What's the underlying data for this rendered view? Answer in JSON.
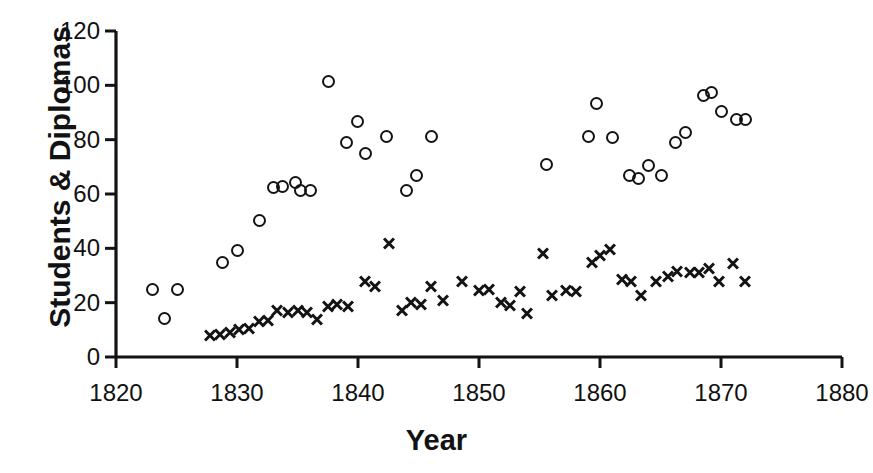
{
  "chart_data": {
    "type": "scatter",
    "title": "",
    "xlabel": "Year",
    "ylabel": "Students & Diplomas",
    "xlim": [
      1820,
      1880
    ],
    "ylim": [
      0,
      120
    ],
    "xticks": [
      1820,
      1830,
      1840,
      1850,
      1860,
      1870,
      1880
    ],
    "xtick_labels": [
      "1820",
      "1830",
      "1840",
      "1850",
      "1860",
      "1870",
      "1880"
    ],
    "yticks": [
      0,
      20,
      40,
      60,
      80,
      100,
      120
    ],
    "ytick_labels": [
      "0",
      "20",
      "40",
      "60",
      "80",
      "100",
      "120"
    ],
    "grid": false,
    "legend": null,
    "marker_color": "#131313",
    "axis_color": "#131313",
    "series": [
      {
        "name": "Students",
        "marker": "circle",
        "points": [
          [
            1823.0,
            25.0
          ],
          [
            1824.0,
            14.5
          ],
          [
            1825.0,
            25.0
          ],
          [
            1828.8,
            35.0
          ],
          [
            1830.0,
            39.5
          ],
          [
            1831.8,
            50.5
          ],
          [
            1833.0,
            62.5
          ],
          [
            1833.7,
            63.0
          ],
          [
            1834.8,
            64.5
          ],
          [
            1835.2,
            61.5
          ],
          [
            1836.0,
            61.5
          ],
          [
            1837.5,
            101.5
          ],
          [
            1839.0,
            79.0
          ],
          [
            1839.9,
            87.0
          ],
          [
            1840.6,
            75.0
          ],
          [
            1842.3,
            81.5
          ],
          [
            1844.0,
            61.5
          ],
          [
            1844.8,
            67.0
          ],
          [
            1846.0,
            81.5
          ],
          [
            1855.5,
            71.0
          ],
          [
            1859.0,
            81.5
          ],
          [
            1859.7,
            93.5
          ],
          [
            1861.0,
            81.0
          ],
          [
            1862.4,
            67.0
          ],
          [
            1863.1,
            66.0
          ],
          [
            1864.0,
            70.5
          ],
          [
            1865.0,
            67.0
          ],
          [
            1866.2,
            79.0
          ],
          [
            1867.0,
            83.0
          ],
          [
            1868.5,
            96.5
          ],
          [
            1869.2,
            97.5
          ],
          [
            1870.0,
            90.5
          ],
          [
            1871.2,
            87.5
          ],
          [
            1872.0,
            87.5
          ]
        ]
      },
      {
        "name": "Diplomas",
        "marker": "cross",
        "points": [
          [
            1827.8,
            8.0
          ],
          [
            1828.6,
            8.5
          ],
          [
            1829.4,
            9.0
          ],
          [
            1830.2,
            10.0
          ],
          [
            1831.0,
            10.5
          ],
          [
            1831.8,
            13.0
          ],
          [
            1832.6,
            13.5
          ],
          [
            1833.3,
            17.0
          ],
          [
            1834.2,
            16.5
          ],
          [
            1835.0,
            17.0
          ],
          [
            1835.8,
            16.5
          ],
          [
            1836.6,
            14.0
          ],
          [
            1837.5,
            18.5
          ],
          [
            1838.3,
            19.5
          ],
          [
            1839.2,
            18.5
          ],
          [
            1840.6,
            28.0
          ],
          [
            1841.4,
            26.0
          ],
          [
            1842.6,
            42.0
          ],
          [
            1843.6,
            17.0
          ],
          [
            1844.4,
            20.0
          ],
          [
            1845.2,
            19.5
          ],
          [
            1846.0,
            26.0
          ],
          [
            1847.0,
            21.0
          ],
          [
            1848.6,
            28.0
          ],
          [
            1850.0,
            24.5
          ],
          [
            1850.8,
            25.0
          ],
          [
            1851.8,
            20.0
          ],
          [
            1852.6,
            19.0
          ],
          [
            1853.4,
            24.0
          ],
          [
            1854.0,
            16.0
          ],
          [
            1855.3,
            38.0
          ],
          [
            1856.0,
            22.5
          ],
          [
            1857.2,
            24.5
          ],
          [
            1858.0,
            24.0
          ],
          [
            1859.3,
            35.0
          ],
          [
            1860.0,
            37.5
          ],
          [
            1860.8,
            39.5
          ],
          [
            1861.8,
            28.5
          ],
          [
            1862.6,
            28.0
          ],
          [
            1863.4,
            22.5
          ],
          [
            1864.6,
            28.0
          ],
          [
            1865.6,
            29.5
          ],
          [
            1866.4,
            31.5
          ],
          [
            1867.4,
            31.0
          ],
          [
            1868.2,
            31.0
          ],
          [
            1869.0,
            32.5
          ],
          [
            1869.8,
            28.0
          ],
          [
            1871.0,
            34.5
          ],
          [
            1872.0,
            28.0
          ]
        ]
      }
    ]
  }
}
